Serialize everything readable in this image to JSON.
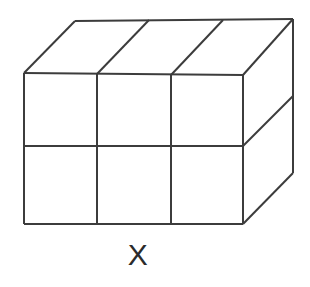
{
  "figure": {
    "kind": "geometric-solid",
    "label": "X",
    "label_position": "below",
    "background_color": "#ffffff",
    "line_color": "#3c3c3c",
    "line_width": 2,
    "fill_color": "#ffffff",
    "grid": {
      "columns": 3,
      "rows": 2,
      "depth": 1,
      "front_face_cells": 6,
      "top_face_cells": 3,
      "right_face_cells": 2
    },
    "vertices": {
      "front_top_left": [
        24,
        73
      ],
      "front_top_right": [
        243,
        75
      ],
      "front_bottom_left": [
        24,
        224
      ],
      "front_bottom_right": [
        243,
        224
      ],
      "back_top_left": [
        75,
        21
      ],
      "back_top_right": [
        293,
        19
      ],
      "back_bottom_right": [
        293,
        173
      ]
    },
    "front_divisions": {
      "vertical_x": [
        97,
        171
      ],
      "horizontal_y": 146
    },
    "top_divisions": {
      "diagonal_front_x": [
        97,
        171
      ],
      "diagonal_back_x": [
        149,
        223
      ]
    },
    "right_divisions": {
      "horizontal_from": [
        243,
        146
      ],
      "horizontal_to": [
        293,
        96
      ]
    }
  }
}
